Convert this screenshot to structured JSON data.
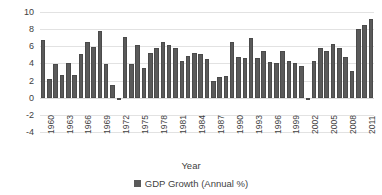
{
  "chart_data": {
    "type": "bar",
    "title": "",
    "xlabel": "Year",
    "ylabel": "Annual %",
    "ylim": [
      -4,
      10
    ],
    "ytick_values": [
      10,
      8,
      6,
      4,
      2,
      0,
      -2,
      -4
    ],
    "ytick_labels": [
      "10",
      "8",
      "6",
      "4",
      "2",
      "0",
      "-2",
      "-4"
    ],
    "grid": true,
    "legend_position": "bottom",
    "series_name": "GDP Growth (Annual %)",
    "bar_color": "#5a5a5a",
    "grid_color": "#e2e2e2",
    "xtick_labels": [
      "1960",
      "1963",
      "1966",
      "1969",
      "1972",
      "1975",
      "1978",
      "1981",
      "1984",
      "1987",
      "1990",
      "1993",
      "1996",
      "1999",
      "2002",
      "2005",
      "2008",
      "2011"
    ],
    "xtick_step": 3,
    "categories": [
      "1960",
      "1961",
      "1962",
      "1963",
      "1964",
      "1965",
      "1966",
      "1967",
      "1968",
      "1969",
      "1970",
      "1971",
      "1972",
      "1973",
      "1974",
      "1975",
      "1976",
      "1977",
      "1978",
      "1979",
      "1980",
      "1981",
      "1982",
      "1983",
      "1984",
      "1985",
      "1986",
      "1987",
      "1988",
      "1989",
      "1990",
      "1991",
      "1992",
      "1993",
      "1994",
      "1995",
      "1996",
      "1997",
      "1998",
      "1999",
      "2000",
      "2001",
      "2002",
      "2003",
      "2004",
      "2005",
      "2006",
      "2007",
      "2008",
      "2009",
      "2010",
      "2011",
      "2012"
    ],
    "values": [
      6.7,
      2.2,
      3.9,
      2.6,
      4.0,
      2.6,
      5.1,
      6.5,
      5.9,
      7.8,
      3.9,
      1.5,
      -0.3,
      7.1,
      3.9,
      6.2,
      3.5,
      5.2,
      5.8,
      6.5,
      6.1,
      5.8,
      4.3,
      4.9,
      5.2,
      5.1,
      4.5,
      1.9,
      2.4,
      2.5,
      6.5,
      4.7,
      4.6,
      7.0,
      4.6,
      5.5,
      4.2,
      4.0,
      5.4,
      4.3,
      4.1,
      3.7,
      -0.2,
      4.3,
      5.8,
      5.4,
      6.3,
      5.8,
      4.8,
      3.1,
      8.0,
      8.5,
      9.2
    ]
  }
}
